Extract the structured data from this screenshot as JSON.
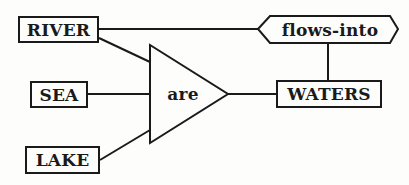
{
  "diagram": {
    "type": "semantic-network",
    "stroke_color": "#1a1a1a",
    "background": "#fdfdfb",
    "nodes": {
      "river": {
        "label": "RIVER",
        "shape": "rectangle"
      },
      "sea": {
        "label": "SEA",
        "shape": "rectangle"
      },
      "lake": {
        "label": "LAKE",
        "shape": "rectangle"
      },
      "are": {
        "label": "are",
        "shape": "triangle"
      },
      "waters": {
        "label": "WATERS",
        "shape": "rectangle"
      },
      "flows_into": {
        "label": "flows-into",
        "shape": "hexagon"
      }
    },
    "edges": [
      {
        "from": "RIVER",
        "to": "are"
      },
      {
        "from": "SEA",
        "to": "are"
      },
      {
        "from": "LAKE",
        "to": "are"
      },
      {
        "from": "are",
        "to": "WATERS"
      },
      {
        "from": "RIVER",
        "to": "flows-into"
      },
      {
        "from": "flows-into",
        "to": "WATERS"
      }
    ]
  }
}
